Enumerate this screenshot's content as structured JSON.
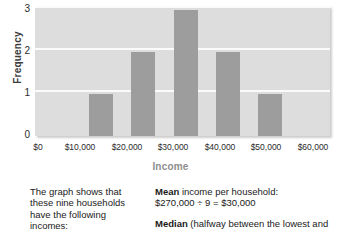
{
  "chart_data": {
    "type": "bar",
    "title": "",
    "xlabel": "Income",
    "ylabel": "Frequency",
    "categories": [
      "$0",
      "$10,000",
      "$20,000",
      "$30,000",
      "$40,000",
      "$50,000",
      "$60,000"
    ],
    "bins": [
      {
        "label": "$0",
        "value": 0
      },
      {
        "label": "$10,000",
        "value": 1
      },
      {
        "label": "$20,000",
        "value": 2
      },
      {
        "label": "$30,000",
        "value": 3
      },
      {
        "label": "$40,000",
        "value": 2
      },
      {
        "label": "$50,000",
        "value": 1
      },
      {
        "label": "$60,000",
        "value": 0
      }
    ],
    "values": [
      0,
      1,
      2,
      3,
      2,
      1,
      0
    ],
    "yticks": [
      "0",
      "1",
      "2",
      "3"
    ],
    "ylim": [
      0,
      3
    ],
    "grid": true,
    "legend": "none",
    "bar_color": "#9d9d9d",
    "plot_background": "#dddddd",
    "gridline_color": "#fbfbfb"
  },
  "caption": {
    "left": {
      "line1": "The graph shows that",
      "line2": "these nine households",
      "line3": "have the following",
      "line4": "incomes:"
    },
    "right": {
      "mean_lead": "Mean",
      "mean_rest": " income per household:",
      "mean_calc": "$270,000 ÷ 9 = $30,000",
      "median_lead": "Median",
      "median_rest": " (halfway between the lowest and"
    }
  }
}
